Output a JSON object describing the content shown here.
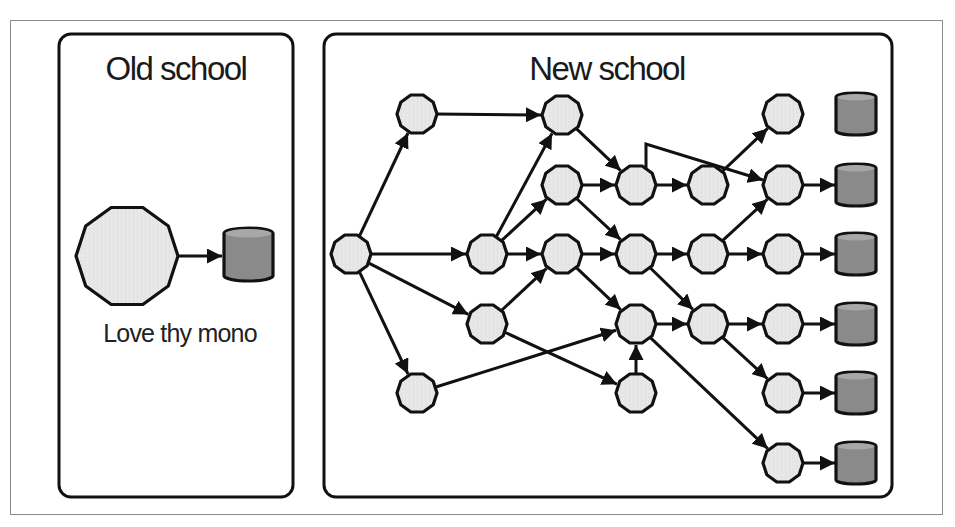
{
  "colors": {
    "stroke": "#111111",
    "node_fill": "#e6e6e6",
    "db_fill": "#8a8a8a",
    "db_top": "#a8a8a8",
    "frame": "#888888",
    "background": "#ffffff"
  },
  "panels": [
    {
      "id": "old",
      "title": "Old school",
      "x": 59,
      "y": 34,
      "w": 234,
      "h": 463,
      "title_x": 176,
      "title_y": 80
    },
    {
      "id": "new",
      "title": "New school",
      "x": 324,
      "y": 34,
      "w": 568,
      "h": 463,
      "title_x": 607,
      "title_y": 80
    }
  ],
  "old_school": {
    "monolith": {
      "shape": "decagon-icon",
      "cx": 127,
      "cy": 256,
      "r": 51
    },
    "database": {
      "shape": "database-icon",
      "x": 224,
      "y": 228,
      "w": 49,
      "h": 53
    },
    "caption": "Love thy mono",
    "caption_x": 180,
    "caption_y": 342
  },
  "new_school": {
    "node_radius": 20,
    "nodes": [
      {
        "id": "a",
        "x": 351,
        "y": 254
      },
      {
        "id": "a1",
        "x": 417,
        "y": 114
      },
      {
        "id": "a2",
        "x": 417,
        "y": 393
      },
      {
        "id": "b1",
        "x": 487,
        "y": 254
      },
      {
        "id": "b2",
        "x": 487,
        "y": 324
      },
      {
        "id": "c1",
        "x": 562,
        "y": 115
      },
      {
        "id": "c2",
        "x": 562,
        "y": 185
      },
      {
        "id": "c3",
        "x": 562,
        "y": 254
      },
      {
        "id": "d1",
        "x": 636,
        "y": 185
      },
      {
        "id": "d2",
        "x": 636,
        "y": 254
      },
      {
        "id": "d3",
        "x": 636,
        "y": 324
      },
      {
        "id": "d4",
        "x": 636,
        "y": 393
      },
      {
        "id": "e1",
        "x": 708,
        "y": 185
      },
      {
        "id": "e2",
        "x": 708,
        "y": 254
      },
      {
        "id": "e3",
        "x": 708,
        "y": 324
      },
      {
        "id": "f1",
        "x": 783,
        "y": 114
      },
      {
        "id": "f2",
        "x": 783,
        "y": 185
      },
      {
        "id": "f3",
        "x": 783,
        "y": 254
      },
      {
        "id": "f4",
        "x": 783,
        "y": 324
      },
      {
        "id": "f5",
        "x": 783,
        "y": 393
      },
      {
        "id": "f6",
        "x": 783,
        "y": 463
      }
    ],
    "databases": [
      {
        "id": "db1",
        "x": 836,
        "y": 93,
        "w": 40,
        "h": 42
      },
      {
        "id": "db2",
        "x": 836,
        "y": 164,
        "w": 40,
        "h": 42
      },
      {
        "id": "db3",
        "x": 836,
        "y": 233,
        "w": 40,
        "h": 42
      },
      {
        "id": "db4",
        "x": 836,
        "y": 303,
        "w": 40,
        "h": 42
      },
      {
        "id": "db5",
        "x": 836,
        "y": 372,
        "w": 40,
        "h": 42
      },
      {
        "id": "db6",
        "x": 836,
        "y": 442,
        "w": 40,
        "h": 42
      }
    ],
    "edges": [
      [
        "a",
        "a1"
      ],
      [
        "a",
        "b1"
      ],
      [
        "a",
        "b2"
      ],
      [
        "a",
        "a2"
      ],
      [
        "a1",
        "c1"
      ],
      [
        "b1",
        "c1"
      ],
      [
        "b1",
        "c2"
      ],
      [
        "b1",
        "c3"
      ],
      [
        "b2",
        "c3"
      ],
      [
        "b2",
        "d4"
      ],
      [
        "a2",
        "d3"
      ],
      [
        "c1",
        "d1"
      ],
      [
        "c2",
        "d1"
      ],
      [
        "c2",
        "d2"
      ],
      [
        "c3",
        "d2"
      ],
      [
        "c3",
        "d3"
      ],
      [
        "d1",
        "e1"
      ],
      [
        "d2",
        "e2"
      ],
      [
        "d2",
        "e3"
      ],
      [
        "d3",
        "e3"
      ],
      [
        "d3",
        "f6"
      ],
      [
        "d4",
        "d3"
      ],
      [
        "e1",
        "f1"
      ],
      [
        "e2",
        "f2"
      ],
      [
        "e2",
        "f3"
      ],
      [
        "e3",
        "f4"
      ],
      [
        "e3",
        "f5"
      ]
    ],
    "bent_edges": [
      {
        "from": "d1",
        "to": "f2",
        "points": [
          [
            646,
            167
          ],
          [
            646,
            144
          ],
          [
            763,
            180
          ]
        ]
      }
    ],
    "db_edges": [
      [
        "f2",
        "db2"
      ],
      [
        "f3",
        "db3"
      ],
      [
        "f4",
        "db4"
      ],
      [
        "f5",
        "db5"
      ],
      [
        "f6",
        "db6"
      ]
    ]
  }
}
